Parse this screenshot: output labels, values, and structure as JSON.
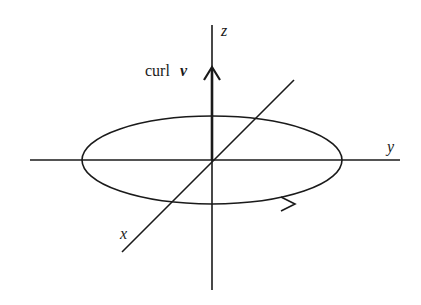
{
  "diagram": {
    "type": "3d-axes-curl",
    "colors": {
      "stroke": "#1a1a1a",
      "background": "#ffffff"
    },
    "labels": {
      "z_axis": "z",
      "y_axis": "y",
      "x_axis": "x",
      "curl_word": "curl",
      "curl_vector": "v"
    },
    "axes": {
      "z": {
        "x": 212,
        "y1": 25,
        "y2": 290
      },
      "y": {
        "y": 160,
        "x1": 30,
        "x2": 400
      },
      "x": {
        "x1": 122,
        "y1": 252,
        "x2": 294,
        "y2": 80
      }
    },
    "ellipse": {
      "cx": 212,
      "cy": 160,
      "rx": 130,
      "ry": 44,
      "direction": "counterclockwise-viewed-from-above"
    },
    "curl_arrow": {
      "from_y": 160,
      "to_y": 67
    }
  }
}
